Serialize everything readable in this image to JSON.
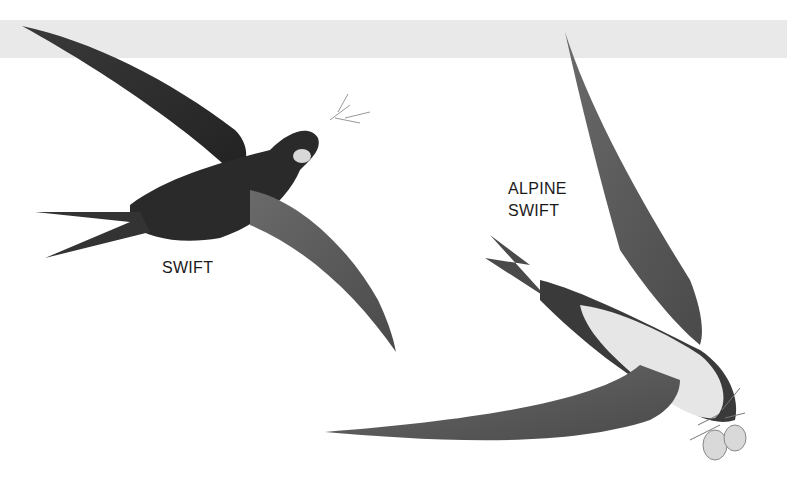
{
  "illustration": {
    "background_band_color": "#e9e9e9",
    "birds": [
      {
        "label": "SWIFT"
      },
      {
        "label_line1": "ALPINE",
        "label_line2": "SWIFT"
      }
    ]
  }
}
